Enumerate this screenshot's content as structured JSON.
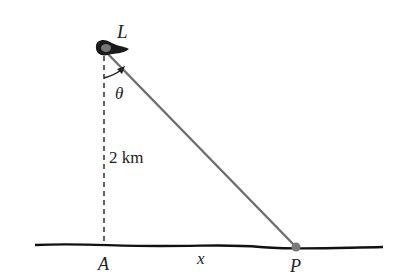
{
  "diagram": {
    "type": "geometry-figure",
    "labels": {
      "lighthouse": "L",
      "angle": "θ",
      "distance": "2 km",
      "point_a": "A",
      "distance_x": "x",
      "point_p": "P"
    },
    "colors": {
      "ground": "#111111",
      "beam": "#6e6e6e",
      "dashed": "#222222",
      "point_p": "#7a7a7a"
    }
  }
}
